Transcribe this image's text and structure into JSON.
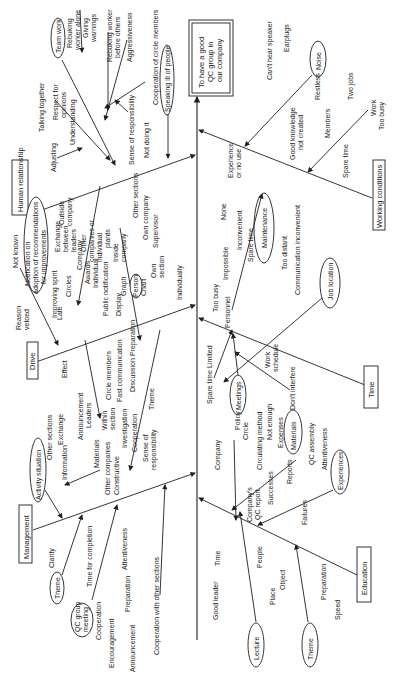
{
  "effect": {
    "line1": "To have a good",
    "line2": "QC group in",
    "line3": "our company"
  },
  "categories": {
    "human_relationship": "Human relationship",
    "drive": "Drive",
    "management": "Management",
    "working_conditions": "Working conditions",
    "time": "Time",
    "education": "Education"
  },
  "human_relationship": {
    "team_work": "Team work",
    "rebuking_alone_1": "Rebuking",
    "rebuking_alone_2": "worker alone",
    "giving_warnings_1": "Giving",
    "giving_warnings_2": "warnings",
    "rebuking_others_1": "Rebuking worker",
    "rebuking_others_2": "before others",
    "aggressiveness": "Aggressiveness",
    "talking_together": "Talking together",
    "respect_1": "Respect for",
    "respect_2": "opinions",
    "understanding": "Understanding",
    "adjusting": "Adjusting",
    "cooperation_members": "Cooperation of circle members",
    "sense_responsibility": "Sense of responsibility",
    "speaking_ill": "Speaking ill of people",
    "not_doing_it": "Not doing it"
  },
  "drive": {
    "not_known": "Not known",
    "notification_1": "Notification on",
    "notification_2": "adoption of recommendations",
    "notification_3": "for improvements",
    "reason_vetoed_1": "Reason",
    "reason_vetoed_2": "vetoed",
    "late": "Late",
    "improving_spirit": "Improving spirit",
    "exchange_1": "Exchange",
    "exchange_2": "between",
    "exchange_3": "leaders",
    "outside_1": "Outside",
    "outside_2": "company",
    "circles": "Circles",
    "company": "Company",
    "other_1": "Other",
    "other_2": "companies or",
    "other_3": "individual",
    "other_4": "plants",
    "awards": "Awards",
    "individual": "Individual",
    "public_notification": "Public notification",
    "inside_1": "Inside",
    "inside_2": "company",
    "other_sections": "Other sections",
    "own_company": "Own company",
    "supervisor": "Supervisor",
    "own_section_1": "Own",
    "own_section_2": "section",
    "display": "Display",
    "graph": "Graph",
    "person": "Person",
    "chart": "Chart",
    "individually": "Individually",
    "effect": "Effect",
    "circle_members": "Circle members",
    "fast_communication": "Fast communication",
    "preparation": "Preparation",
    "discussion": "Discussion",
    "theme": "Theme",
    "within_1": "Within",
    "within_2": "section",
    "leaders": "Leaders",
    "announcement": "Announcement",
    "investigation": "Investigation",
    "cooperation": "Cooperation",
    "sense_1": "Sense of",
    "sense_2": "responsibility"
  },
  "management": {
    "activity_situation": "Activity situation",
    "other_sections": "Other sections",
    "exchange": "Exchange",
    "information": "Information",
    "materials": "Materials",
    "other_companies": "Other companies",
    "constructive": "Constructive",
    "theme": "Theme",
    "clarity": "Clarity",
    "time_completion": "Time for completion",
    "qc_meeting_1": "QC group",
    "qc_meeting_2": "meeting",
    "attentiveness": "Attentiveness",
    "cooperation": "Cooperation",
    "preparation": "Preparation",
    "encouragement": "Encouragement",
    "announcement": "Announcement",
    "cooperation_other": "Cooperation with other sections"
  },
  "working_conditions": {
    "noise": "Noise",
    "cant_hear": "Can't hear speaker",
    "earplugs": "Earplugs",
    "restless": "Restless",
    "good_knowledge_1": "Good knowledge",
    "good_knowledge_2": "not created",
    "members": "Members",
    "two_jobs": "Two jobs",
    "work": "Work",
    "too_busy": "Too busy",
    "spare_time": "Spare time",
    "maintenance": "Maintenance",
    "experience_1": "Experience",
    "experience_2": "or no use",
    "none": "None",
    "inconvenient": "Inconvenient",
    "spare_time_2": "Spare time",
    "impossible": "Impossible",
    "too_busy_2": "Too busy",
    "personnel": "Personnel",
    "too_distant": "Too distant",
    "communication": "Communication inconvenient",
    "job_location": "Job location"
  },
  "time": {
    "limited": "Limited",
    "spare_time": "Spare time",
    "meetings": "Meetings",
    "work_schedule_1": "Work",
    "work_schedule_2": "schedule",
    "dont_interfere": "Don't interfere"
  },
  "education": {
    "company": "Company",
    "policy": "Policy",
    "circle": "Circle",
    "circulating_method": "Circulating method",
    "not_enough": "Not enough",
    "expenses": "Expenses",
    "materials": "Materials",
    "qc_report_1": "Company's",
    "qc_report_2": "QC report",
    "successes": "Successes",
    "reports": "Reports",
    "qc_assembly": "QC assembly",
    "attentiveness": "Attentiveness",
    "experiences": "Experiences",
    "failures": "Failures",
    "time": "Time",
    "people": "People",
    "good_leader": "Good leader",
    "place": "Place",
    "lecture": "Lecture",
    "object": "Object",
    "preparation": "Preparation",
    "speed": "Speed",
    "theme": "Theme"
  }
}
